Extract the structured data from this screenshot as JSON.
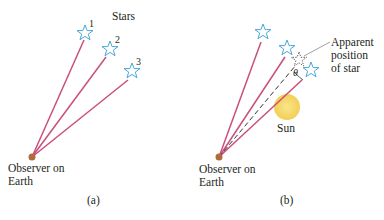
{
  "panel_a": {
    "stars_label": "Stars",
    "star_numbers": [
      "1",
      "2",
      "3"
    ],
    "observer_label_line1": "Observer on",
    "observer_label_line2": "Earth",
    "caption": "(a)"
  },
  "panel_b": {
    "apparent_label_line1": "Apparent",
    "apparent_label_line2": "position",
    "apparent_label_line3": "of star",
    "angle_symbol": "θ",
    "sun_label": "Sun",
    "observer_label_line1": "Observer on",
    "observer_label_line2": "Earth",
    "caption": "(b)"
  },
  "colors": {
    "ray": "#c94f7c",
    "star_outline": "#4aa8d8",
    "observer_dot": "#b06a3b",
    "sun": "#f5d76e",
    "dashed": "#333333",
    "leader": "#888888"
  }
}
